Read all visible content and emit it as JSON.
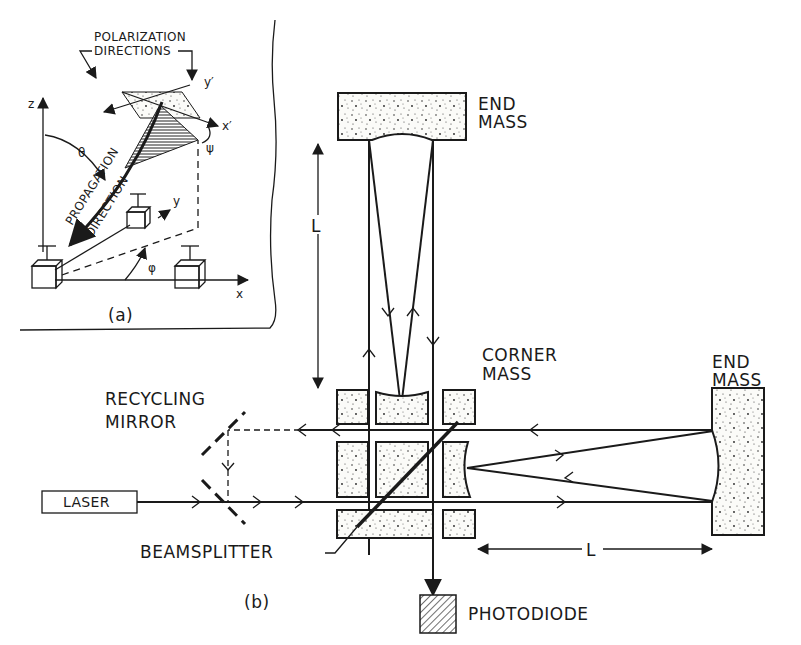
{
  "figure": {
    "panel_a": {
      "caption": "(a)",
      "labels": {
        "polarization_line1": "POLARIZATION",
        "polarization_line2": "DIRECTIONS",
        "propagation": "PROPAGATION",
        "direction": "DIRECTION",
        "axis_z": "z",
        "axis_x": "x",
        "axis_y": "y",
        "axis_xp": "x′",
        "axis_yp": "y′",
        "theta": "θ",
        "phi": "φ",
        "psi": "ψ"
      }
    },
    "panel_b": {
      "caption": "(b)",
      "labels": {
        "end_mass_top_line1": "END",
        "end_mass_top_line2": "MASS",
        "end_mass_right_line1": "END",
        "end_mass_right_line2": "MASS",
        "corner_mass_line1": "CORNER",
        "corner_mass_line2": "MASS",
        "recycling_line1": "RECYCLING",
        "recycling_line2": "MIRROR",
        "laser": "LASER",
        "beamsplitter": "BEAMSPLITTER",
        "photodiode": "PHOTODIODE",
        "arm_length_vertical": "L",
        "arm_length_horizontal": "L"
      }
    }
  }
}
